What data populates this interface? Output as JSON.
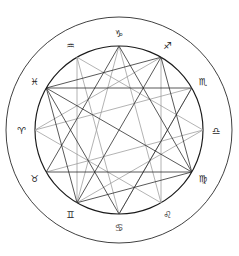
{
  "figure": {
    "background_color": "#ffffff",
    "width": 239,
    "height": 256
  },
  "wheel": {
    "center_x": 119,
    "center_y": 130,
    "outer_radius": 113,
    "glyph_ring_radius": 97,
    "inner_radius": 84,
    "outer_ring_color": "#2b2b2b",
    "inner_circle_color": "#1a1a1a"
  },
  "signs": [
    {
      "name": "capricorn",
      "glyph": "♑",
      "angle_deg": 270,
      "label": "Capricorn",
      "cx": 119,
      "cy": 33,
      "gx": 119.0,
      "gy": 33.0
    },
    {
      "name": "sagittarius",
      "glyph": "♐",
      "angle_deg": 300,
      "label": "Sagittarius",
      "cx": 167,
      "cy": 46,
      "gx": 167.5,
      "gy": 45.5
    },
    {
      "name": "scorpio",
      "glyph": "♏",
      "angle_deg": 330,
      "label": "Scorpio",
      "cx": 203,
      "cy": 81,
      "gx": 203.0,
      "gy": 81.5
    },
    {
      "name": "libra",
      "glyph": "♎",
      "angle_deg": 0,
      "label": "Libra",
      "cx": 216,
      "cy": 130,
      "gx": 216.0,
      "gy": 130.0
    },
    {
      "name": "virgo",
      "glyph": "♍",
      "angle_deg": 30,
      "label": "Virgo",
      "cx": 203,
      "cy": 178,
      "gx": 203.0,
      "gy": 178.5
    },
    {
      "name": "leo",
      "glyph": "♌",
      "angle_deg": 60,
      "label": "Leo",
      "cx": 167,
      "cy": 214,
      "gx": 167.5,
      "gy": 214.5
    },
    {
      "name": "cancer",
      "glyph": "♋",
      "angle_deg": 90,
      "label": "Cancer",
      "cx": 119,
      "cy": 227,
      "gx": 119.0,
      "gy": 227.0
    },
    {
      "name": "gemini",
      "glyph": "♊",
      "angle_deg": 120,
      "label": "Gemini",
      "cx": 70,
      "cy": 214,
      "gx": 70.5,
      "gy": 214.5
    },
    {
      "name": "taurus",
      "glyph": "♉",
      "angle_deg": 150,
      "label": "Taurus",
      "cx": 34,
      "cy": 178,
      "gx": 34.5,
      "gy": 178.5
    },
    {
      "name": "aries",
      "glyph": "♈",
      "angle_deg": 180,
      "label": "Aries",
      "cx": 21,
      "cy": 130,
      "gx": 21.5,
      "gy": 130.0
    },
    {
      "name": "pisces",
      "glyph": "♓",
      "angle_deg": 210,
      "label": "Pisces",
      "cx": 34,
      "cy": 81,
      "gx": 34.5,
      "gy": 81.5
    },
    {
      "name": "aquarius",
      "glyph": "♒",
      "angle_deg": 240,
      "label": "Aquarius",
      "cx": 70,
      "cy": 46,
      "gx": 70.5,
      "gy": 45.5
    }
  ],
  "aspects": {
    "hard_color": "#222222",
    "soft_color": "#9a9a9a",
    "hard_lines": [
      {
        "from": "capricorn",
        "to": "taurus",
        "kind": "trine"
      },
      {
        "from": "capricorn",
        "to": "virgo",
        "kind": "trine"
      },
      {
        "from": "pisces",
        "to": "scorpio",
        "kind": "trine"
      },
      {
        "from": "pisces",
        "to": "cancer",
        "kind": "trine"
      },
      {
        "from": "taurus",
        "to": "virgo",
        "kind": "trine"
      },
      {
        "from": "scorpio",
        "to": "cancer",
        "kind": "trine"
      },
      {
        "from": "sagittarius",
        "to": "virgo",
        "kind": "square"
      },
      {
        "from": "sagittarius",
        "to": "pisces",
        "kind": "square"
      },
      {
        "from": "gemini",
        "to": "virgo",
        "kind": "square"
      },
      {
        "from": "gemini",
        "to": "pisces",
        "kind": "square"
      },
      {
        "from": "sagittarius",
        "to": "gemini",
        "kind": "opposition"
      },
      {
        "from": "virgo",
        "to": "pisces",
        "kind": "opposition"
      }
    ],
    "soft_lines": [
      {
        "from": "aquarius",
        "to": "libra",
        "kind": "trine"
      },
      {
        "from": "aquarius",
        "to": "gemini",
        "kind": "trine"
      },
      {
        "from": "libra",
        "to": "gemini",
        "kind": "trine"
      },
      {
        "from": "capricorn",
        "to": "leo",
        "kind": "quincunx"
      },
      {
        "from": "capricorn",
        "to": "gemini",
        "kind": "quincunx"
      },
      {
        "from": "aries",
        "to": "leo",
        "kind": "trine"
      },
      {
        "from": "aries",
        "to": "sagittarius",
        "kind": "trine"
      },
      {
        "from": "leo",
        "to": "sagittarius",
        "kind": "trine"
      },
      {
        "from": "cancer",
        "to": "scorpio",
        "kind": "trine"
      },
      {
        "from": "cancer",
        "to": "aquarius",
        "kind": "quincunx"
      },
      {
        "from": "taurus",
        "to": "libra",
        "kind": "quincunx"
      },
      {
        "from": "aries",
        "to": "scorpio",
        "kind": "quincunx"
      }
    ]
  }
}
